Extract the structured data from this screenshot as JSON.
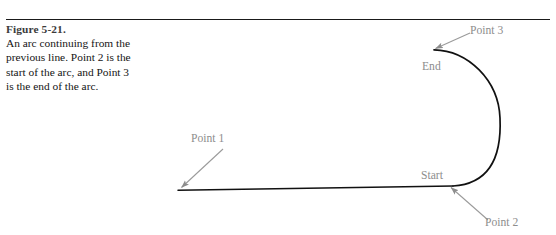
{
  "page": {
    "background_color": "#ffffff",
    "width": 556,
    "height": 235
  },
  "rule": {
    "color": "#1a1a1a"
  },
  "caption": {
    "figure_label": "Figure 5-21.",
    "figure_text": "An arc continuing from the previous line. Point 2 is the start of the arc, and Point 3 is the end of the arc.",
    "label_color": "#3b3b3b",
    "text_color": "#141414"
  },
  "diagram": {
    "stroke_color": "#111111",
    "callout_color": "#8d8d8d",
    "labels": {
      "point1": "Point 1",
      "point2": "Point 2",
      "point3": "Point 3",
      "start": "Start",
      "end": "End"
    },
    "geometry": {
      "line": {
        "x1": 178,
        "y1": 190,
        "x2": 453,
        "y2": 186
      },
      "arc": {
        "start_x": 453,
        "start_y": 186,
        "end_x": 434,
        "end_y": 50,
        "rightmost_x": 500,
        "sweep": "clockwise"
      },
      "arrow_point1": {
        "from_x": 222,
        "from_y": 148,
        "to_x": 179,
        "to_y": 188
      },
      "arrow_point2": {
        "from_x": 487,
        "from_y": 221,
        "to_x": 449,
        "to_y": 186
      },
      "arrow_point3": {
        "from_x": 470,
        "from_y": 33,
        "to_x": 433,
        "to_y": 49
      }
    }
  }
}
